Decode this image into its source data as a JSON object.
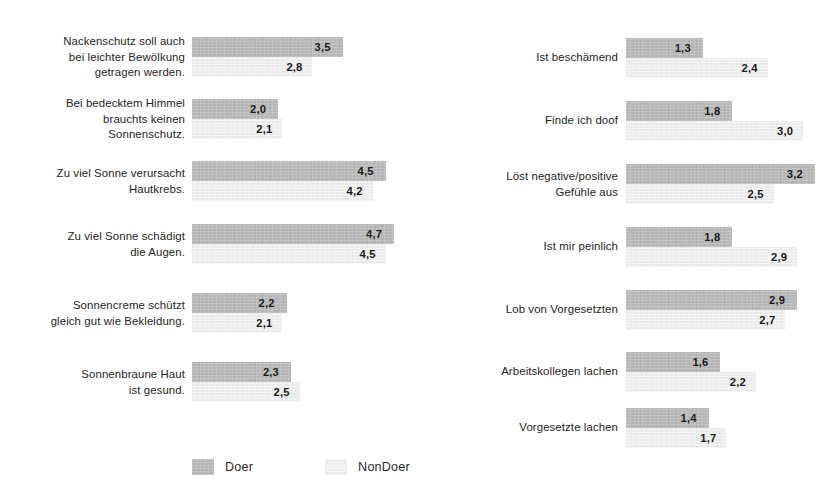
{
  "chart_data": {
    "type": "bar",
    "title": "",
    "subtitle": "",
    "xlabel": "",
    "ylabel": "",
    "orientation": "horizontal",
    "grid": false,
    "legend_position": "bottom-left",
    "value_decimal_separator": ",",
    "legend": [
      {
        "name": "Doer",
        "color": "#b6b6b6"
      },
      {
        "name": "NonDoer",
        "color": "#ececec"
      }
    ],
    "series_names": [
      "Doer",
      "NonDoer"
    ],
    "panels": [
      {
        "name": "left-panel",
        "px_per_unit": 43,
        "categories": [
          "Nackenschutz soll auch\nbei leichter Bewölkung\ngetragen werden.",
          "Bei bedecktem Himmel\nbrauchts keinen\nSonnenschutz.",
          "Zu viel Sonne verursacht\nHautkrebs.",
          "Zu viel Sonne schädigt\ndie Augen.",
          "Sonnencreme schützt\ngleich gut wie Bekleidung.",
          "Sonnenbraune Haut\nist gesund."
        ],
        "series": [
          {
            "name": "Doer",
            "values": [
              3.5,
              2.0,
              4.5,
              4.7,
              2.2,
              2.3
            ],
            "labels": [
              "3,5",
              "2,0",
              "4,5",
              "4,7",
              "2,2",
              "2,3"
            ]
          },
          {
            "name": "NonDoer",
            "values": [
              2.8,
              2.1,
              4.2,
              4.5,
              2.1,
              2.5
            ],
            "labels": [
              "2,8",
              "2,1",
              "4,2",
              "4,5",
              "2,1",
              "2,5"
            ]
          }
        ],
        "group_tops": [
          37,
          99,
          161,
          224,
          293,
          362
        ]
      },
      {
        "name": "right-panel",
        "px_per_unit": 59,
        "categories": [
          "Ist beschämend",
          "Finde ich doof",
          "Löst negative/positive\nGefühle aus",
          "Ist mir peinlich",
          "Lob von Vorgesetzten",
          "Arbeitskollegen lachen",
          "Vorgesetzte lachen"
        ],
        "series": [
          {
            "name": "Doer",
            "values": [
              1.3,
              1.8,
              3.2,
              1.8,
              2.9,
              1.6,
              1.4
            ],
            "labels": [
              "1,3",
              "1,8",
              "3,2",
              "1,8",
              "2,9",
              "1,6",
              "1,4"
            ]
          },
          {
            "name": "NonDoer",
            "values": [
              2.4,
              3.0,
              2.5,
              2.9,
              2.7,
              2.2,
              1.7
            ],
            "labels": [
              "2,4",
              "3,0",
              "2,5",
              "2,9",
              "2,7",
              "2,2",
              "1,7"
            ]
          }
        ],
        "group_tops": [
          38,
          101,
          164,
          227,
          290,
          352,
          408
        ]
      }
    ]
  }
}
